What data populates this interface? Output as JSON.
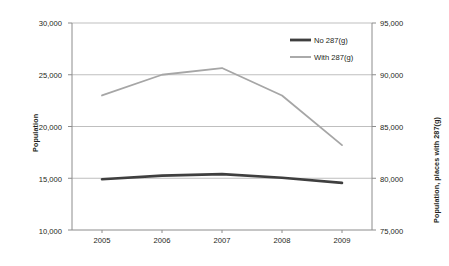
{
  "chart_data": {
    "type": "line",
    "title": "",
    "xlabel": "",
    "ylabel": "Population",
    "y2label": "Population, places with 287(g)",
    "categories": [
      "2005",
      "2006",
      "2007",
      "2008",
      "2009"
    ],
    "x_tick_labels": [
      "2005",
      "2006",
      "2007",
      "2008",
      "2009"
    ],
    "ylim": [
      10000,
      30000
    ],
    "y_tick_labels": [
      "10,000",
      "15,000",
      "20,000",
      "25,000",
      "30,000"
    ],
    "y_ticks": [
      10000,
      15000,
      20000,
      25000,
      30000
    ],
    "y2lim": [
      75000,
      95000
    ],
    "y2_tick_labels": [
      "75,000",
      "80,000",
      "85,000",
      "90,000",
      "95,000"
    ],
    "y2_ticks": [
      75000,
      80000,
      85000,
      90000,
      95000
    ],
    "grid": true,
    "legend_position": "top-right",
    "series": [
      {
        "name": "No 287(g)",
        "axis": "left",
        "color": "#3f3f3f",
        "width": 2.6,
        "values": [
          14900,
          15250,
          15400,
          15050,
          14550
        ]
      },
      {
        "name": "With 287(g)",
        "axis": "right",
        "color": "#a6a6a6",
        "width": 1.8,
        "values": [
          88000,
          90000,
          90650,
          88000,
          83200
        ]
      }
    ]
  },
  "legend": {
    "items": [
      {
        "label": "No 287(g)",
        "color": "#3f3f3f"
      },
      {
        "label": "With 287(g)",
        "color": "#a6a6a6"
      }
    ]
  }
}
